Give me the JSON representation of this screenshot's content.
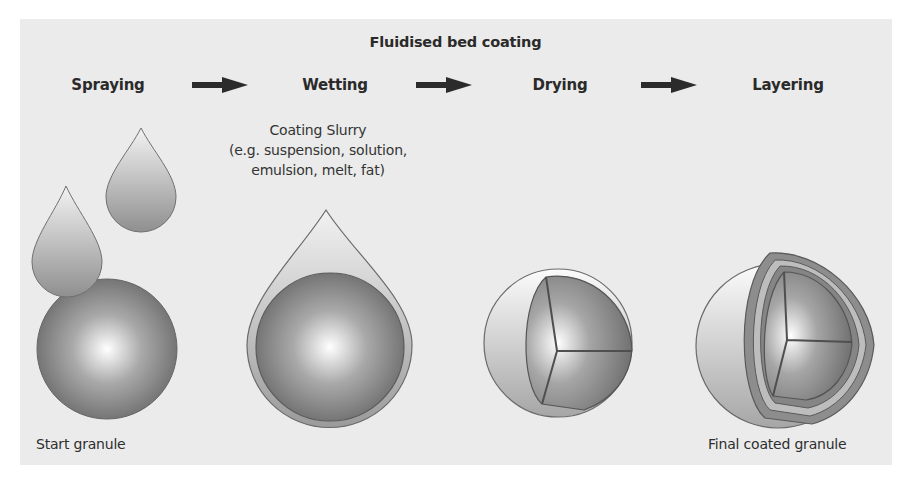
{
  "diagram": {
    "title": "Fluidised bed coating",
    "stages": [
      {
        "label": "Spraying"
      },
      {
        "label": "Wetting"
      },
      {
        "label": "Drying"
      },
      {
        "label": "Layering"
      }
    ],
    "arrows": [
      {
        "from": "Spraying",
        "to": "Wetting",
        "icon": "right-arrow-icon"
      },
      {
        "from": "Wetting",
        "to": "Drying",
        "icon": "right-arrow-icon"
      },
      {
        "from": "Drying",
        "to": "Layering",
        "icon": "right-arrow-icon"
      }
    ],
    "annotations": {
      "slurry_line1": "Coating Slurry",
      "slurry_line2": "(e.g. suspension, solution,",
      "slurry_line3": "emulsion, melt, fat)"
    },
    "captions": {
      "start": "Start granule",
      "final": "Final coated granule"
    },
    "colors": {
      "background": "#ebebeb",
      "text": "#2a2a2a",
      "arrow": "#2b2b2b",
      "granule_dark": "#6e6e6e",
      "granule_light": "#ffffff",
      "outline": "#555555"
    }
  }
}
